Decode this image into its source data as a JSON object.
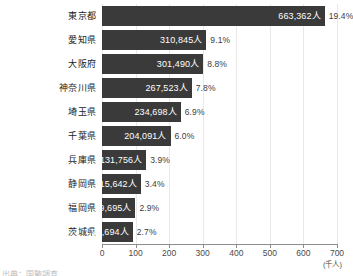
{
  "chart_data": {
    "type": "bar",
    "orientation": "horizontal",
    "title": "",
    "subtitle": "",
    "xlabel": "",
    "ylabel": "",
    "unit_label": "(千人)",
    "xlim": [
      0,
      700
    ],
    "x_ticks": [
      0,
      100,
      200,
      300,
      400,
      500,
      600,
      700
    ],
    "x_tick_labels": [
      "0",
      "100",
      "200",
      "300",
      "400",
      "500",
      "600",
      "700"
    ],
    "grid": true,
    "grid_axis": "x",
    "legend": false,
    "bar_color": "#3a3a3a",
    "value_label_color": "#ffffff",
    "pct_label_color": "#3c3c3c",
    "gridline_color": "#e9e9e9",
    "axis_color": "#8d8d8d",
    "categories": [
      "東京都",
      "愛知県",
      "大阪府",
      "神奈川県",
      "埼玉県",
      "千葉県",
      "兵庫県",
      "静岡県",
      "福岡県",
      "茨城県"
    ],
    "values": [
      663.362,
      310.845,
      301.49,
      267.523,
      234.698,
      204.091,
      131.756,
      115.642,
      99.695,
      91.694
    ],
    "value_labels": [
      "663,362人",
      "310,845人",
      "301,490人",
      "267,523人",
      "234,698人",
      "204,091人",
      "131,756人",
      "115,642人",
      "99,695人",
      "91,694人"
    ],
    "percent_labels": [
      "19.4%",
      "9.1%",
      "8.8%",
      "7.8%",
      "6.9%",
      "6.0%",
      "3.9%",
      "3.4%",
      "2.9%",
      "2.7%"
    ],
    "percent_values": [
      19.4,
      9.1,
      8.8,
      7.8,
      6.9,
      6.0,
      3.9,
      3.4,
      2.9,
      2.7
    ]
  },
  "caption": {
    "text": "出典：国勢調査"
  }
}
